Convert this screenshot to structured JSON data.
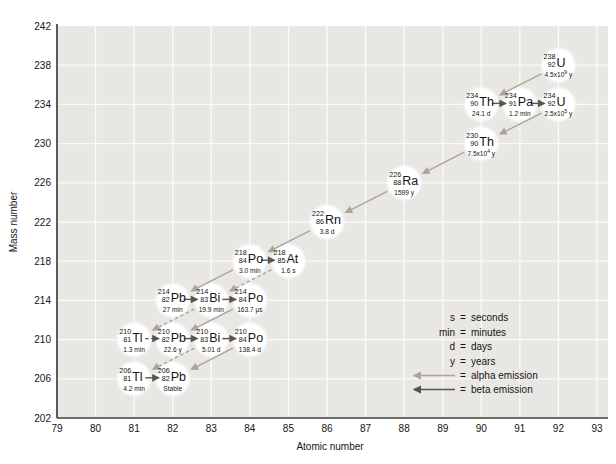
{
  "chart_data": {
    "type": "scatter",
    "title": "",
    "xlabel": "Atomic number",
    "ylabel": "Mass number",
    "xlim": [
      79,
      93
    ],
    "ylim": [
      202,
      242
    ],
    "x_ticks": [
      79,
      80,
      81,
      82,
      83,
      84,
      85,
      86,
      87,
      88,
      89,
      90,
      91,
      92,
      93
    ],
    "y_ticks": [
      202,
      206,
      210,
      214,
      218,
      222,
      226,
      230,
      234,
      238,
      242
    ],
    "grid": true,
    "colors": {
      "plot_bg": "#e9e7e3",
      "grid_line": "#fafaf8",
      "axis": "#3f3f3d",
      "alpha_arrow": "#aaa399",
      "beta_arrow": "#56564f",
      "bubble": "#ffffff",
      "text": "#141414"
    },
    "nuclides": [
      {
        "id": "U238",
        "symbol": "U",
        "mass": 238,
        "z": 92,
        "half_life": "4.5x10^9 y"
      },
      {
        "id": "Th234",
        "symbol": "Th",
        "mass": 234,
        "z": 90,
        "half_life": "24.1 d"
      },
      {
        "id": "Pa234",
        "symbol": "Pa",
        "mass": 234,
        "z": 91,
        "half_life": "1.2 min"
      },
      {
        "id": "U234",
        "symbol": "U",
        "mass": 234,
        "z": 92,
        "half_life": "2.5x10^5 y"
      },
      {
        "id": "Th230",
        "symbol": "Th",
        "mass": 230,
        "z": 90,
        "half_life": "7.5x10^4 y"
      },
      {
        "id": "Ra226",
        "symbol": "Ra",
        "mass": 226,
        "z": 88,
        "half_life": "1599 y"
      },
      {
        "id": "Rn222",
        "symbol": "Rn",
        "mass": 222,
        "z": 86,
        "half_life": "3.8 d"
      },
      {
        "id": "Po218",
        "symbol": "Po",
        "mass": 218,
        "z": 84,
        "half_life": "3.0 min"
      },
      {
        "id": "At218",
        "symbol": "At",
        "mass": 218,
        "z": 85,
        "half_life": "1.6 s"
      },
      {
        "id": "Pb214",
        "symbol": "Pb",
        "mass": 214,
        "z": 82,
        "half_life": "27 min"
      },
      {
        "id": "Bi214",
        "symbol": "Bi",
        "mass": 214,
        "z": 83,
        "half_life": "19.9 min"
      },
      {
        "id": "Po214",
        "symbol": "Po",
        "mass": 214,
        "z": 84,
        "half_life": "163.7 μs"
      },
      {
        "id": "Tl210",
        "symbol": "Tl",
        "mass": 210,
        "z": 81,
        "half_life": "1.3 min"
      },
      {
        "id": "Pb210",
        "symbol": "Pb",
        "mass": 210,
        "z": 82,
        "half_life": "22.6 y"
      },
      {
        "id": "Bi210",
        "symbol": "Bi",
        "mass": 210,
        "z": 83,
        "half_life": "5.01 d"
      },
      {
        "id": "Po210",
        "symbol": "Po",
        "mass": 210,
        "z": 84,
        "half_life": "138.4 d"
      },
      {
        "id": "Tl206",
        "symbol": "Tl",
        "mass": 206,
        "z": 81,
        "half_life": "4.2 min"
      },
      {
        "id": "Pb206",
        "symbol": "Pb",
        "mass": 206,
        "z": 82,
        "half_life": "Stable"
      }
    ],
    "decays": [
      {
        "from": "U238",
        "to": "Th234",
        "type": "alpha",
        "dashed": false
      },
      {
        "from": "Th234",
        "to": "Pa234",
        "type": "beta",
        "dashed": false
      },
      {
        "from": "Pa234",
        "to": "U234",
        "type": "beta",
        "dashed": false
      },
      {
        "from": "U234",
        "to": "Th230",
        "type": "alpha",
        "dashed": false
      },
      {
        "from": "Th230",
        "to": "Ra226",
        "type": "alpha",
        "dashed": false
      },
      {
        "from": "Ra226",
        "to": "Rn222",
        "type": "alpha",
        "dashed": false
      },
      {
        "from": "Rn222",
        "to": "Po218",
        "type": "alpha",
        "dashed": false
      },
      {
        "from": "Po218",
        "to": "At218",
        "type": "beta",
        "dashed": false
      },
      {
        "from": "Po218",
        "to": "Pb214",
        "type": "alpha",
        "dashed": false
      },
      {
        "from": "At218",
        "to": "Bi214",
        "type": "alpha",
        "dashed": true
      },
      {
        "from": "Pb214",
        "to": "Bi214",
        "type": "beta",
        "dashed": false
      },
      {
        "from": "Bi214",
        "to": "Po214",
        "type": "beta",
        "dashed": false
      },
      {
        "from": "Bi214",
        "to": "Tl210",
        "type": "alpha",
        "dashed": true
      },
      {
        "from": "Po214",
        "to": "Pb210",
        "type": "alpha",
        "dashed": false
      },
      {
        "from": "Tl210",
        "to": "Pb210",
        "type": "beta",
        "dashed": true
      },
      {
        "from": "Pb210",
        "to": "Bi210",
        "type": "beta",
        "dashed": false
      },
      {
        "from": "Bi210",
        "to": "Po210",
        "type": "beta",
        "dashed": false
      },
      {
        "from": "Bi210",
        "to": "Tl206",
        "type": "alpha",
        "dashed": true
      },
      {
        "from": "Po210",
        "to": "Pb206",
        "type": "alpha",
        "dashed": false
      },
      {
        "from": "Tl206",
        "to": "Pb206",
        "type": "beta",
        "dashed": false
      }
    ],
    "legend": {
      "equals": "=",
      "units": [
        {
          "term": "s",
          "definition": "seconds"
        },
        {
          "term": "min",
          "definition": "minutes"
        },
        {
          "term": "d",
          "definition": "days"
        },
        {
          "term": "y",
          "definition": "years"
        }
      ],
      "arrows": [
        {
          "type": "alpha",
          "definition": "alpha emission"
        },
        {
          "type": "beta",
          "definition": "beta emission"
        }
      ]
    }
  }
}
